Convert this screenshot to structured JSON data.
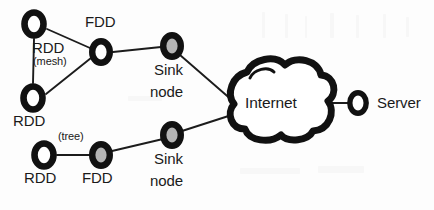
{
  "diagram": {
    "background_color": "#fdfdfd",
    "stroke_color": "#111111",
    "node_fill_white": "#ffffff",
    "node_fill_grey": "#b4b4b4",
    "nodes": [
      {
        "id": "rdd-top",
        "label": "RDD",
        "kind": "rdd",
        "fill": "white",
        "cx": 34,
        "cy": 24,
        "rx": 13,
        "ry": 15,
        "ring": 6.5,
        "label_x": 32,
        "label_y": 41,
        "label_size": "main"
      },
      {
        "id": "rdd-bottom-left",
        "label": "RDD",
        "kind": "rdd",
        "fill": "white",
        "cx": 33,
        "cy": 98,
        "rx": 13,
        "ry": 15,
        "ring": 6.5,
        "label_x": 16,
        "label_y": 115,
        "label_size": "main"
      },
      {
        "id": "fdd-top",
        "label": "FDD",
        "kind": "fdd",
        "fill": "white",
        "cx": 101,
        "cy": 52,
        "rx": 12,
        "ry": 14,
        "ring": 6.5,
        "label_x": 84,
        "label_y": 17,
        "label_size": "main"
      },
      {
        "id": "sink-top",
        "label": "Sink node",
        "kind": "sink",
        "fill": "grey",
        "cx": 172,
        "cy": 46,
        "rx": 12,
        "ry": 14,
        "ring": 6.5,
        "label_x": 153,
        "label_y": 62,
        "label_size": "main"
      },
      {
        "id": "rdd-tree",
        "label": "RDD",
        "kind": "rdd",
        "fill": "white",
        "cx": 44,
        "cy": 155,
        "rx": 13,
        "ry": 15,
        "ring": 6.5,
        "label_x": 26,
        "label_y": 173,
        "label_size": "main"
      },
      {
        "id": "fdd-tree",
        "label": "FDD",
        "kind": "fdd",
        "fill": "grey",
        "cx": 101,
        "cy": 155,
        "rx": 12,
        "ry": 14,
        "ring": 6.5,
        "label_x": 83,
        "label_y": 173,
        "label_size": "main"
      },
      {
        "id": "sink-bottom",
        "label": "Sink node",
        "kind": "sink",
        "fill": "grey",
        "cx": 172,
        "cy": 135,
        "rx": 12,
        "ry": 14,
        "ring": 6.5,
        "label_x": 153,
        "label_y": 152,
        "label_size": "main"
      },
      {
        "id": "server",
        "label": "Server",
        "kind": "server",
        "fill": "white",
        "cx": 358,
        "cy": 103,
        "rx": 11,
        "ry": 13,
        "ring": 5.5,
        "label_x": 377,
        "label_y": 96,
        "label_size": "main"
      }
    ],
    "cloud": {
      "id": "internet-cloud",
      "label": "Internet",
      "label_x": 249,
      "label_y": 94,
      "fill": "#ffffff",
      "stroke_width": 7
    },
    "annotations": [
      {
        "id": "mesh-annotation",
        "text": "(mesh)",
        "x": 33,
        "y": 58,
        "size": "small"
      },
      {
        "id": "tree-annotation",
        "text": "(tree)",
        "x": 57,
        "y": 132,
        "size": "small"
      }
    ],
    "links": [
      {
        "id": "link-rdd-top-rdd-bottom",
        "from": "rdd-top",
        "to": "rdd-bottom-left",
        "x1": 34,
        "y1": 39,
        "x2": 33,
        "y2": 83
      },
      {
        "id": "link-rdd-top-fdd",
        "from": "rdd-top",
        "to": "fdd-top",
        "x1": 47,
        "y1": 29,
        "x2": 90,
        "y2": 48
      },
      {
        "id": "link-rdd-bottom-fdd",
        "from": "rdd-bottom-left",
        "to": "fdd-top",
        "x1": 46,
        "y1": 94,
        "x2": 91,
        "y2": 58
      },
      {
        "id": "link-fdd-sink-top",
        "from": "fdd-top",
        "to": "sink-top",
        "x1": 113,
        "y1": 52,
        "x2": 161,
        "y2": 47
      },
      {
        "id": "link-sink-top-cloud",
        "from": "sink-top",
        "to": "internet-cloud",
        "x1": 182,
        "y1": 54,
        "x2": 240,
        "y2": 107
      },
      {
        "id": "link-rdd-tree-fdd-tree",
        "from": "rdd-tree",
        "to": "fdd-tree",
        "x1": 57,
        "y1": 155,
        "x2": 90,
        "y2": 155
      },
      {
        "id": "link-fdd-tree-sink",
        "from": "fdd-tree",
        "to": "sink-bottom",
        "x1": 112,
        "y1": 151,
        "x2": 162,
        "y2": 139
      },
      {
        "id": "link-sink-bottom-cloud",
        "from": "sink-bottom",
        "to": "internet-cloud",
        "x1": 183,
        "y1": 131,
        "x2": 240,
        "y2": 112
      },
      {
        "id": "link-cloud-server",
        "from": "internet-cloud",
        "to": "server",
        "x1": 320,
        "y1": 103,
        "x2": 348,
        "y2": 103
      }
    ]
  }
}
